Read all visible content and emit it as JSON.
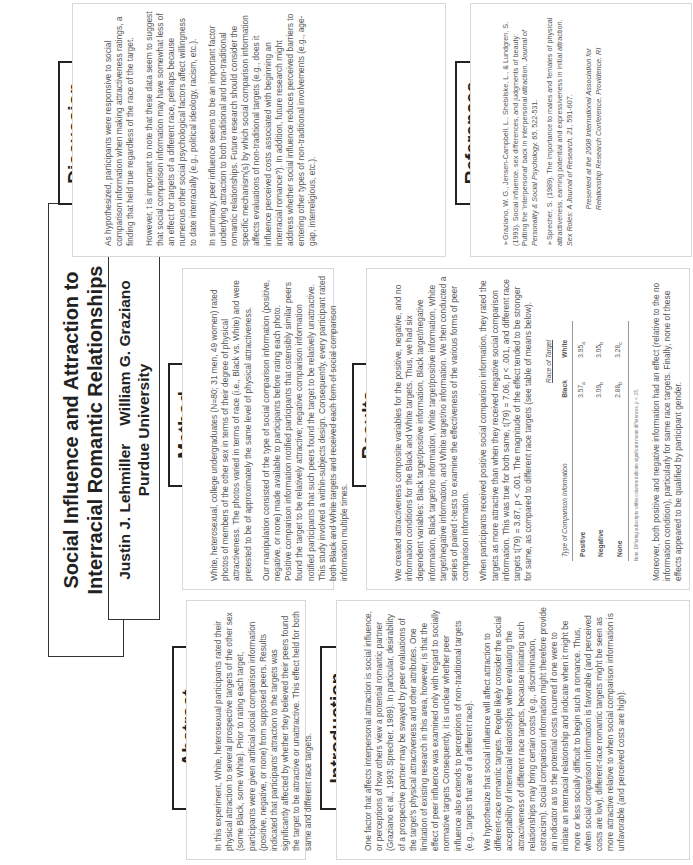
{
  "title": {
    "line1": "Social Influence and Attraction to",
    "line2": "Interracial Romantic Relationships",
    "author1": "Justin J. Lehmiller",
    "author2": "William G. Graziano",
    "affiliation": "Purdue University"
  },
  "abstract": {
    "heading": "Abstract",
    "paragraphs": [
      "In this experiment, White, heterosexual participants rated their physical attraction to several prospective targets of the other sex (some Black, some White). Prior to rating each target, participants were given artificial social comparison information (positive, negative, or none) from supposed peers. Results indicated that participants' attraction to the targets was significantly affected by whether they believed their peers found the target to be attractive or unattractive. This effect held for both same and different race targets."
    ]
  },
  "introduction": {
    "heading": "Introduction",
    "paragraphs": [
      "One factor that affects interpersonal attraction is social influence, or perceptions of how others view a potential romantic partner (Graziano et al., 1993; Sprecher, 1989). In particular, desirability of a prospective partner may be swayed by peer evaluations of the target's physical attractiveness and other attributes. One limitation of existing research in this area, however, is that the effect of peer influence was examined only with regard to socially normative targets Consequently, it is unclear whether peer influence also extends to perceptions of non-traditional targets (e.g., targets that are of a different race).",
      "We hypothesize that social influence will affect attraction to different-race romantic targets. People likely consider the social acceptability of interracial relationships when evaluating the attractiveness of different race targets, because initiating such relationships may bring certain costs (e.g., discrimination, ostracism). Social comparison information might therefore provide an indicator as to the potential costs incurred if one were to initiate an interracial relationship and indicate when it might be more or less socially difficult to begin such a romance. Thus, when social comparison information is favorable (and perceived costs are low), different-race romantic targets might be seen as more attractive relative to when social comparison information is unfavorable (and perceived costs are high)."
    ]
  },
  "method": {
    "heading": "Method",
    "paragraphs": [
      "White, heterosexual, college undergraduates (N=80; 31 men, 49 women) rated photos of members of the other sex in terms of their degree of physical attractiveness. The photos varied in terms of race (i.e., Black vs. White) and were pretested to be of approximately the same level of physical attractiveness.",
      "Our manipulation consisted of the type of social comparison information (positive, negative, or none) made available to participants before rating each photo. Positive comparison information notified participants that ostensibly similar peers found the target to be relatively attractive; negative comparison information notified participants that such peers found the target to be relatively unattractive. This study involved a within-subjects design. Consequently, every participant rated both Black and White targets and received each form of social comparison information multiple times."
    ]
  },
  "results": {
    "heading": "Results",
    "paragraphs": [
      "We created attractiveness composite variables for the positive, negative, and no information conditions for the Black and White targets. Thus, we had six dependent variables: Black target/positive information, Black target/negative information, Black target/no information, White target/positive information, White target/negative information, and White target/no information. We then conducted a series of paired t-tests to examine the effectiveness of the various forms of peer comparison information.",
      "When participants received positive social comparison information, they rated the targets as more attractive than when they received negative social comparison information. This was true for both same, t(79) = 7.06, p < .001, and different race targets t(79) = 3.87, p < .001. The magnitude of the effect tended to be stronger for same, as compared to different race targets (see table of means below)."
    ],
    "table": {
      "caption": "Race of Target",
      "row_header": "Type of Comparison Information",
      "columns": [
        "Black",
        "White"
      ],
      "rows": [
        {
          "label": "Positive",
          "black": "3.57",
          "black_sub": "a",
          "white": "3.95",
          "white_sub": "a"
        },
        {
          "label": "Negative",
          "black": "3.09",
          "black_sub": "b",
          "white": "3.05",
          "white_sub": "b"
        },
        {
          "label": "None",
          "black": "2.88",
          "black_sub": "b",
          "white": "3.28",
          "white_sub": "c"
        }
      ],
      "note": "Note. Differing subscripts within columns indicate significant mean differences, p < .05."
    },
    "closing": "Moreover, both positive and negative information had an effect (relative to the no information condition), particularly for same race targets. Finally, none of these effects appeared to be qualified by participant gender."
  },
  "discussion": {
    "heading": "Discussion",
    "paragraphs": [
      "As hypothesized, participants were responsive to social comparison information when making attractiveness ratings, a finding that held true regardless of the race of the target.",
      "However, t is important to note that these data seem to suggest that social comparison information may have somewhat less of an effect for targets of a different race, perhaps because numerous other social psychological factors affect willingness to date interracially (e.g., political ideology, racism, etc.).",
      "In summary, peer influence seems to be an important factor underlying attraction to both traditional and non-traditional romantic relationships. Future research should consider the specific mechanism(s) by which social comparison information affects evaluations of non-traditional targets (e.g., does it influence perceived costs associated with beginning an interracial romance?). In addition, future research might address whether social influence reduces perceived barriers to entering other types of non-traditional involvements (e.g., age-gap, interreligious, etc.)."
    ]
  },
  "references": {
    "heading": "References",
    "items": [
      {
        "text": "➢Graziano, W. G., Jensen-Campbell, L., Shebilske, L., & Lundgren, S. (1993). Social influence, sex differences, and judgments of beauty: Putting the 'interpersonal' back in interpersonal attraction. ",
        "journal": "Journal of Personality & Social Psychology, 65",
        "tail": ", 522-531."
      },
      {
        "text": "➢Sprecher, S. (1989). The importance to males and females of physical attractiveness, earning potential and expressiveness in initial attraction. ",
        "journal": "Sex Roles: A Journal of Research, 21",
        "tail": ", 591-607."
      }
    ],
    "presented_line1": "Presented at the 2008 International Association for",
    "presented_line2": "Relationship Research Conference, Providence, RI"
  }
}
